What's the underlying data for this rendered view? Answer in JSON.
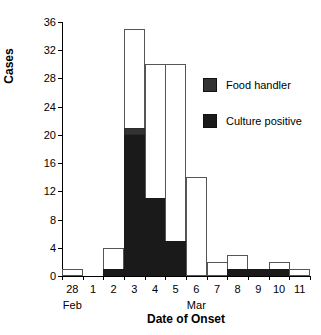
{
  "chart_data": {
    "type": "bar",
    "title": "",
    "xlabel": "Date of Onset",
    "ylabel": "Cases",
    "ylim": [
      0,
      36
    ],
    "yticks": [
      0,
      4,
      8,
      12,
      16,
      20,
      24,
      28,
      32,
      36
    ],
    "grid": false,
    "stacked": true,
    "legend_position": "upper right",
    "categories": [
      "28",
      "1",
      "2",
      "3",
      "4",
      "5",
      "6",
      "7",
      "8",
      "9",
      "10",
      "11"
    ],
    "month_labels": [
      {
        "label": "Feb",
        "category": "28"
      },
      {
        "label": "Mar",
        "category": "6"
      }
    ],
    "series": [
      {
        "name": "Culture positive",
        "color": "#1a1a1a",
        "values": [
          0,
          0,
          1,
          20,
          11,
          5,
          0,
          0,
          1,
          1,
          1,
          0
        ]
      },
      {
        "name": "Food handler",
        "color": "#333333",
        "values": [
          0,
          0,
          0,
          1,
          0,
          0,
          0,
          0,
          0,
          0,
          0,
          0
        ]
      },
      {
        "name": "Total cases",
        "color": "#ffffff",
        "values": [
          1,
          0,
          4,
          35,
          30,
          30,
          14,
          2,
          3,
          1,
          2,
          1
        ]
      }
    ],
    "bar_totals": [
      1,
      0,
      4,
      35,
      30,
      30,
      14,
      2,
      3,
      1,
      2,
      1
    ]
  },
  "legend": {
    "items": [
      {
        "label": "Food handler",
        "color": "#333333"
      },
      {
        "label": "Culture positive",
        "color": "#1a1a1a"
      }
    ]
  },
  "axes": {
    "y_title": "Cases",
    "x_title": "Date of Onset"
  }
}
